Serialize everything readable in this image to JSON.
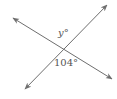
{
  "diagram": {
    "type": "intersecting-lines",
    "line_color": "#6e6e6e",
    "label_color": "#555555",
    "lines": [
      {
        "name": "line-a",
        "from": [
          12,
          17
        ],
        "to": [
          113,
          80
        ]
      },
      {
        "name": "line-b",
        "from": [
          24,
          90
        ],
        "to": [
          108,
          4
        ]
      }
    ],
    "labels": {
      "top_angle": "y°",
      "bottom_angle": "104°"
    }
  }
}
